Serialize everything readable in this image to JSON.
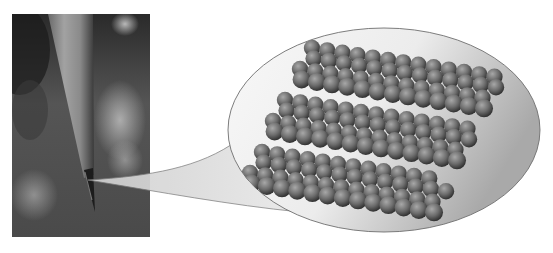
{
  "figure": {
    "photo": {
      "x": 12,
      "y": 14,
      "width": 138,
      "height": 223,
      "background": "#5a5a5a",
      "pencil": {
        "body_color": "#8c8c8c",
        "lead_color": "#1c1c1c",
        "tip_x": 95,
        "tip_y": 212
      }
    },
    "callout": {
      "fill": "#e2e2e2",
      "stroke": "#7a7a7a",
      "origin_x": 88,
      "origin_y": 180
    },
    "bubble": {
      "cx": 384,
      "cy": 130,
      "rx": 156,
      "ry": 102,
      "fill_light": "#f6f6f6",
      "fill_dark": "#b4b4b4",
      "stroke": "#6e6e6e"
    },
    "atoms": {
      "layers": 3,
      "rows_per_layer": 4,
      "cols_per_row": 13,
      "radius": 8.2,
      "color_light": "#a8a8a8",
      "color_mid": "#6c6c6c",
      "color_dark": "#2e2e2e",
      "layer_origins": [
        {
          "x": 312,
          "y": 48
        },
        {
          "x": 285,
          "y": 100
        },
        {
          "x": 262,
          "y": 152
        }
      ],
      "col_step_x": 15.2,
      "col_step_y": 2.4,
      "row_step_x": -6.0,
      "row_step_y": 10.5
    }
  }
}
